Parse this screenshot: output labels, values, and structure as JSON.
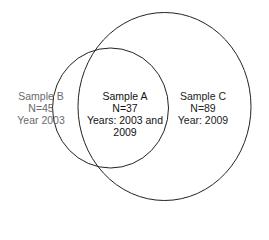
{
  "diagram": {
    "type": "venn",
    "stroke_color": "#222222",
    "sets": [
      {
        "id": "sample_b",
        "title": "Sample B",
        "n": "N=45",
        "year": "Year  2003",
        "text_color": "#6a6a6a"
      },
      {
        "id": "sample_a",
        "title": "Sample A",
        "n": "N=37",
        "year_line1": "Years: 2003 and",
        "year_line2": "2009",
        "text_color": "#111111"
      },
      {
        "id": "sample_c",
        "title": "Sample C",
        "n": "N=89",
        "year": "Year: 2009",
        "text_color": "#222222"
      }
    ]
  }
}
